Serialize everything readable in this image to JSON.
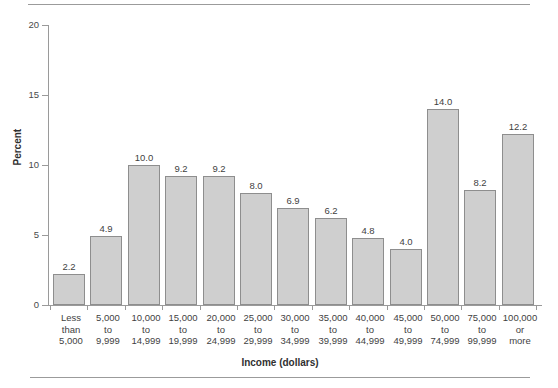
{
  "chart_data": {
    "type": "bar",
    "title": "",
    "xlabel": "Income (dollars)",
    "ylabel": "Percent",
    "ylim": [
      0,
      20
    ],
    "yticks": [
      0,
      5,
      10,
      15,
      20
    ],
    "ytick_labels": [
      "0",
      "5",
      "10",
      "15",
      "20"
    ],
    "grid": false,
    "legend": false,
    "categories": [
      "Less\nthan\n5,000",
      "5,000\nto\n9,999",
      "10,000\nto\n14,999",
      "15,000\nto\n19,999",
      "20,000\nto\n24,999",
      "25,000\nto\n29,999",
      "30,000\nto\n34,999",
      "35,000\nto\n39,999",
      "40,000\nto\n44,999",
      "45,000\nto\n49,999",
      "50,000\nto\n74,999",
      "75,000\nto\n99,999",
      "100,000\nor\nmore"
    ],
    "values": [
      2.2,
      4.9,
      10.0,
      9.2,
      9.2,
      8.0,
      6.9,
      6.2,
      4.8,
      4.0,
      14.0,
      8.2,
      12.2
    ],
    "value_labels": [
      "2.2",
      "4.9",
      "10.0",
      "9.2",
      "9.2",
      "8.0",
      "6.9",
      "6.2",
      "4.8",
      "4.0",
      "14.0",
      "8.2",
      "12.2"
    ],
    "colors": {
      "bar_fill": "#cfcfcf",
      "bar_edge": "#8e8e8e",
      "axis": "#9a9a9a",
      "text": "#3f3f3f",
      "background": "#ffffff",
      "rule": "#9b9b9b"
    }
  }
}
